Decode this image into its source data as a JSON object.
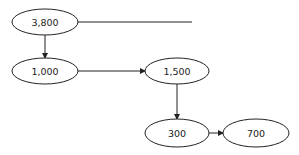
{
  "diagram": {
    "nodes": [
      {
        "id": "n1",
        "label": "3,800",
        "cx": 45,
        "cy": 22,
        "rx": 33,
        "ry": 13
      },
      {
        "id": "n2",
        "label": "1,000",
        "cx": 45,
        "cy": 71,
        "rx": 33,
        "ry": 13
      },
      {
        "id": "n3",
        "label": "1,500",
        "cx": 177,
        "cy": 71,
        "rx": 32,
        "ry": 13
      },
      {
        "id": "n4",
        "label": "300",
        "cx": 177,
        "cy": 133,
        "rx": 32,
        "ry": 14
      },
      {
        "id": "n5",
        "label": "700",
        "cx": 256,
        "cy": 133,
        "rx": 33,
        "ry": 14
      }
    ],
    "edges": [
      {
        "from": "n1",
        "to": null,
        "x1": 78,
        "y1": 22,
        "x2": 192,
        "y2": 22,
        "arrow": false
      },
      {
        "from": "n1",
        "to": "n2",
        "x1": 45,
        "y1": 35,
        "x2": 45,
        "y2": 58,
        "arrow": true
      },
      {
        "from": "n2",
        "to": "n3",
        "x1": 78,
        "y1": 71,
        "x2": 145,
        "y2": 71,
        "arrow": true
      },
      {
        "from": "n3",
        "to": "n4",
        "x1": 177,
        "y1": 84,
        "x2": 177,
        "y2": 119,
        "arrow": true
      },
      {
        "from": "n4",
        "to": "n5",
        "x1": 209,
        "y1": 133,
        "x2": 223,
        "y2": 133,
        "arrow": true
      }
    ],
    "colors": {
      "stroke": "#222222",
      "background": "#ffffff"
    }
  }
}
